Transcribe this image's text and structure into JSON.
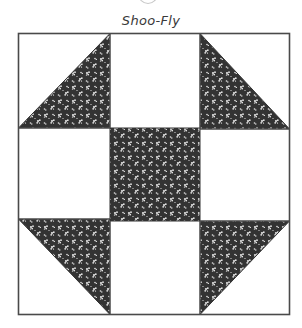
{
  "diagram": {
    "title": "Shoo-Fly",
    "type": "quilt-block",
    "grid": "3x3 nine-patch",
    "colors": {
      "background": "#ffffff",
      "outline": "#4a4a4a",
      "print_fabric": "#333333",
      "print_motif": "#e8e8e8"
    },
    "patches": [
      {
        "position": "top-left",
        "shape": "half-square-triangle",
        "dark_half": "lower-right"
      },
      {
        "position": "top-center",
        "shape": "square",
        "fill": "plain"
      },
      {
        "position": "top-right",
        "shape": "half-square-triangle",
        "dark_half": "lower-left"
      },
      {
        "position": "middle-left",
        "shape": "square",
        "fill": "plain"
      },
      {
        "position": "center",
        "shape": "square",
        "fill": "print"
      },
      {
        "position": "middle-right",
        "shape": "square",
        "fill": "plain"
      },
      {
        "position": "bottom-left",
        "shape": "half-square-triangle",
        "dark_half": "upper-right"
      },
      {
        "position": "bottom-center",
        "shape": "square",
        "fill": "plain"
      },
      {
        "position": "bottom-right",
        "shape": "half-square-triangle",
        "dark_half": "upper-left"
      }
    ]
  }
}
